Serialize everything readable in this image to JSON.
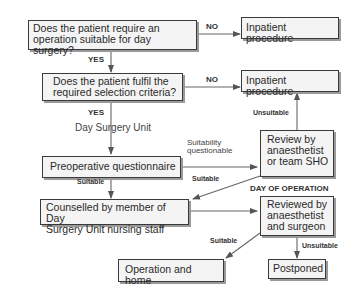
{
  "diagram": {
    "type": "flowchart",
    "nodes": {
      "q_day_surgery": "Does the patient require an operation suitable for day surgery?",
      "inpatient_1": "Inpatient procedure",
      "q_criteria": "Does the patient fulfil the required selection criteria?",
      "inpatient_2": "Inpatient procedure",
      "day_surgery_unit": "Day Surgery Unit",
      "questionnaire": "Preoperative questionnaire",
      "review_sho": "Review by anaesthetist or team SHO",
      "counselled": "Counselled by member of Day Surgery Unit nursing staff",
      "reviewed_surgeon": "Reviewed by anaesthetist and surgeon",
      "operation_home": "Operation and home",
      "postponed": "Postponed"
    },
    "q1_line1": "Does the patient require an",
    "q1_line2": "operation suitable for day surgery?",
    "q2_line1": "Does the patient fulfil the",
    "q2_line2": "required selection criteria?",
    "sho_line1": "Review by",
    "sho_line2": "anaesthetist",
    "sho_line3": "or team SHO",
    "couns_line1": "Counselled by member of Day",
    "couns_line2": "Surgery Unit nursing staff",
    "surg_line1": "Reviewed by",
    "surg_line2": "anaesthetist",
    "surg_line3": "and surgeon",
    "labels": {
      "no_1": "NO",
      "yes_1": "YES",
      "no_2": "NO",
      "yes_2": "YES",
      "unsuitable_1": "Unsuitable",
      "suitability_q_1": "Suitability",
      "suitability_q_2": "questionable",
      "suitable_1": "Suitable",
      "suitable_2": "Suitable",
      "day_of_operation": "DAY OF OPERATION",
      "suitable_3": "Suitable",
      "unsuitable_2": "Unsuitable"
    },
    "edges": [
      {
        "from": "q_day_surgery",
        "to": "inpatient_1",
        "label": "NO"
      },
      {
        "from": "q_day_surgery",
        "to": "q_criteria",
        "label": "YES"
      },
      {
        "from": "q_criteria",
        "to": "inpatient_2",
        "label": "NO"
      },
      {
        "from": "q_criteria",
        "to": "questionnaire",
        "label": "YES"
      },
      {
        "from": "questionnaire",
        "to": "review_sho",
        "label": "Suitability questionable"
      },
      {
        "from": "review_sho",
        "to": "inpatient_2",
        "label": "Unsuitable"
      },
      {
        "from": "review_sho",
        "to": "counselled",
        "label": "Suitable"
      },
      {
        "from": "questionnaire",
        "to": "counselled",
        "label": "Suitable"
      },
      {
        "from": "counselled",
        "to": "reviewed_surgeon",
        "label": ""
      },
      {
        "from": "reviewed_surgeon",
        "to": "operation_home",
        "label": "Suitable"
      },
      {
        "from": "reviewed_surgeon",
        "to": "postponed",
        "label": "Unsuitable"
      }
    ]
  }
}
